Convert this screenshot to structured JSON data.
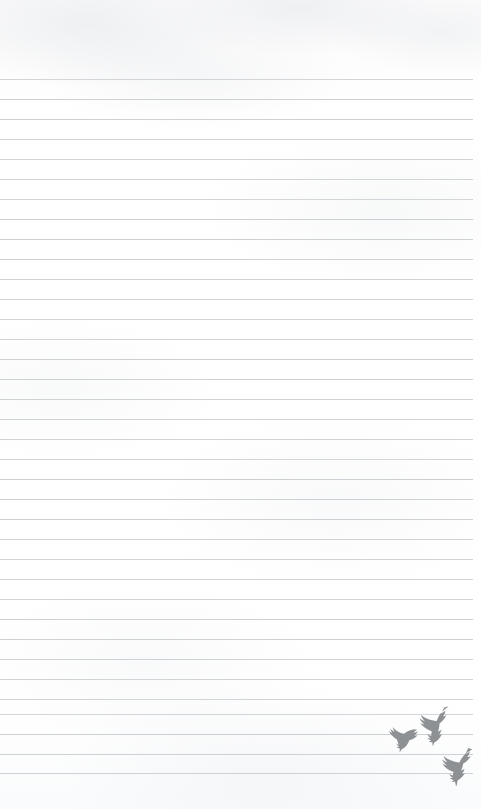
{
  "page": {
    "width": 481,
    "height": 809,
    "background_color": "#fdfdfd",
    "paper_tone": "#ffffff"
  },
  "ruling": {
    "line_color": "#c9ccd1",
    "line_thickness_px": 1,
    "line_spacing_px": 20,
    "first_line_y": 79,
    "last_line_y": 773,
    "line_count": 36,
    "left_margin_px": 0,
    "right_edge_px": 473,
    "top_blank_margin_px": 79,
    "bottom_blank_margin_px": 36,
    "line_positions": [
      79,
      99,
      119,
      139,
      159,
      179,
      199,
      219,
      239,
      259,
      279,
      299,
      319,
      339,
      359,
      379,
      399,
      419,
      439,
      459,
      479,
      499,
      519,
      539,
      559,
      579,
      599,
      619,
      639,
      659,
      679,
      699,
      714,
      734,
      754,
      773
    ]
  },
  "decoration": {
    "name": "flying-birds-silhouettes",
    "color": "#8e9194",
    "count": 3,
    "position": "bottom-right",
    "birds": [
      {
        "name": "bird-upper",
        "x": 40,
        "y": 8,
        "width": 36,
        "height": 38,
        "rotation": -8
      },
      {
        "name": "bird-middle",
        "x": 12,
        "y": 28,
        "width": 32,
        "height": 26,
        "rotation": 6
      },
      {
        "name": "bird-lower",
        "x": 66,
        "y": 48,
        "width": 36,
        "height": 38,
        "rotation": -4
      }
    ]
  },
  "content": {
    "written_text": "",
    "note": "blank ruled page"
  }
}
